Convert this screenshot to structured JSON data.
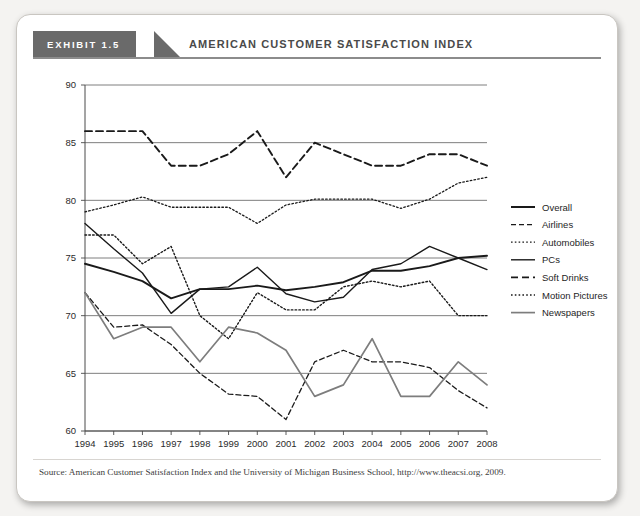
{
  "exhibit": {
    "badge_label": "EXHIBIT 1.5",
    "title": "AMERICAN CUSTOMER SATISFACTION INDEX"
  },
  "source_note": "Source: American Customer Satisfaction Index and the University of Michigan Business School, http://www.theacsi.org, 2009.",
  "colors": {
    "badge_background": "#6a6a6a",
    "title_text": "#4a4a4a",
    "card_background": "#ffffff",
    "page_background": "#f4f3f1",
    "gridline": "#6f6f6f",
    "dark_series": "#1a1a1a",
    "gray_series": "#7d7d7d",
    "axis": "#4a4a4a"
  },
  "chart_data": {
    "type": "line",
    "title": "AMERICAN CUSTOMER SATISFACTION INDEX",
    "xlabel": "",
    "ylabel": "",
    "x": [
      1994,
      1995,
      1996,
      1997,
      1998,
      1999,
      2000,
      2001,
      2002,
      2003,
      2004,
      2005,
      2006,
      2007,
      2008
    ],
    "xtick_labels": [
      "1994",
      "1995",
      "1996",
      "1997",
      "1998",
      "1999",
      "2000",
      "2001",
      "2002",
      "2003",
      "2004",
      "2005",
      "2006",
      "2007",
      "2008"
    ],
    "ytick_labels": [
      "60",
      "65",
      "70",
      "75",
      "80",
      "85",
      "90"
    ],
    "yticks": [
      60,
      65,
      70,
      75,
      80,
      85,
      90
    ],
    "ylim": [
      60,
      90
    ],
    "xlim": [
      1994,
      2008
    ],
    "grid": true,
    "legend_position": "right",
    "series": [
      {
        "name": "Overall",
        "style": "solid",
        "color": "#1a1a1a",
        "width": 1.9,
        "values": [
          74.5,
          73.8,
          73.0,
          71.5,
          72.3,
          72.3,
          72.6,
          72.2,
          72.5,
          72.9,
          73.9,
          73.9,
          74.3,
          75.0,
          75.2
        ]
      },
      {
        "name": "Airlines",
        "style": "dashed",
        "color": "#1a1a1a",
        "width": 1.3,
        "values": [
          72.0,
          69.0,
          69.2,
          67.5,
          65.0,
          63.2,
          63.0,
          61.0,
          66.0,
          67.0,
          66.0,
          66.0,
          65.5,
          63.5,
          62.0
        ]
      },
      {
        "name": "Automobiles",
        "style": "dotted",
        "color": "#1a1a1a",
        "width": 1.3,
        "values": [
          79.0,
          79.6,
          80.3,
          79.4,
          79.4,
          79.4,
          78.0,
          79.6,
          80.1,
          80.1,
          80.1,
          79.3,
          80.1,
          81.5,
          82.0
        ]
      },
      {
        "name": "PCs",
        "style": "solid",
        "color": "#1a1a1a",
        "width": 1.4,
        "values": [
          78.0,
          75.8,
          73.7,
          70.2,
          72.3,
          72.5,
          74.2,
          71.9,
          71.2,
          71.6,
          74.0,
          74.5,
          76.0,
          75.0,
          74.0
        ]
      },
      {
        "name": "Soft Drinks",
        "style": "dashed",
        "color": "#1a1a1a",
        "width": 1.9,
        "values": [
          86.0,
          86.0,
          86.0,
          83.0,
          83.0,
          84.0,
          86.0,
          82.0,
          85.0,
          84.0,
          83.0,
          83.0,
          84.0,
          84.0,
          83.0
        ]
      },
      {
        "name": "Motion Pictures",
        "style": "dotted",
        "color": "#1a1a1a",
        "width": 1.4,
        "values": [
          77.0,
          77.0,
          74.5,
          76.0,
          70.0,
          68.0,
          72.0,
          70.5,
          70.5,
          72.5,
          73.0,
          72.5,
          73.0,
          70.0,
          70.0
        ]
      },
      {
        "name": "Newspapers",
        "style": "solid",
        "color": "#7d7d7d",
        "width": 1.7,
        "values": [
          72.0,
          68.0,
          69.0,
          69.0,
          66.0,
          69.0,
          68.5,
          67.0,
          63.0,
          64.0,
          68.0,
          63.0,
          63.0,
          66.0,
          64.0
        ]
      }
    ]
  }
}
